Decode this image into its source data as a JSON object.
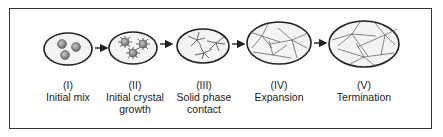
{
  "stages": [
    {
      "numeral": "(I)",
      "name_line1": "Initial mix",
      "name_line2": ""
    },
    {
      "numeral": "(II)",
      "name_line1": "Initial crystal",
      "name_line2": "growth"
    },
    {
      "numeral": "(III)",
      "name_line1": "Solid phase",
      "name_line2": "contact"
    },
    {
      "numeral": "(IV)",
      "name_line1": "Expansion",
      "name_line2": ""
    },
    {
      "numeral": "(V)",
      "name_line1": "Termination",
      "name_line2": ""
    }
  ],
  "colors": {
    "outline": "#222222",
    "fill": "#f0f0f0",
    "particle": "#8a8a8a"
  }
}
